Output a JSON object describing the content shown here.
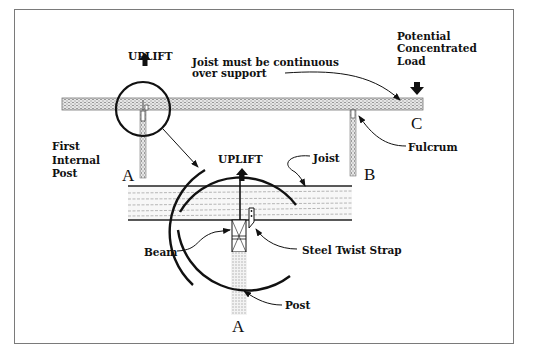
{
  "diagram": {
    "title_labels": {
      "uplift_top": "UPLIFT",
      "uplift_detail": "UPLIFT",
      "joist_note_line1": "Joist must be continuous",
      "joist_note_line2": "over support",
      "load_line1": "Potential",
      "load_line2": "Concentrated",
      "load_line3": "Load",
      "fulcrum": "Fulcrum",
      "first_post_line1": "First",
      "first_post_line2": "Internal",
      "first_post_line3": "Post",
      "joist": "Joist",
      "beam": "Beam",
      "steel_twist_strap": "Steel Twist Strap",
      "post": "Post"
    },
    "point_labels": {
      "a_top": "A",
      "b": "B",
      "c": "C",
      "a_bottom": "A"
    },
    "colors": {
      "line": "#111111",
      "timber": "#bdbdbd",
      "frame": "#7a7a7a"
    }
  }
}
